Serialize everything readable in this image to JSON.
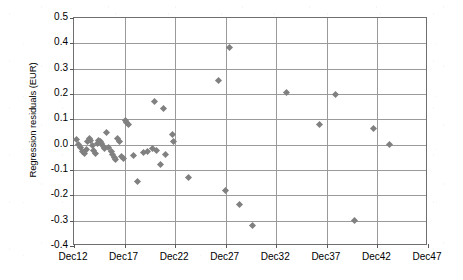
{
  "chart_data": {
    "type": "scatter",
    "title": "",
    "xlabel": "",
    "ylabel": "Regression residuals (EUR)",
    "ylim": [
      -0.4,
      0.5
    ],
    "xlim": [
      12,
      47
    ],
    "grid": true,
    "legend": false,
    "marker": {
      "shape": "diamond",
      "color": "#808080",
      "size": 5
    },
    "axis_color": "#6f6f6f",
    "gridline_color": "#9a9a9a",
    "x_tick_labels": [
      "Dec12",
      "Dec17",
      "Dec22",
      "Dec27",
      "Dec32",
      "Dec37",
      "Dec42",
      "Dec47"
    ],
    "x_tick_values": [
      12,
      17,
      22,
      27,
      32,
      37,
      42,
      47
    ],
    "y_tick_labels": [
      "0.5",
      "0.4",
      "0.3",
      "0.2",
      "0.1",
      "0.0",
      "-0.1",
      "-0.2",
      "-0.3",
      "-0.4"
    ],
    "y_tick_values": [
      0.5,
      0.4,
      0.3,
      0.2,
      0.1,
      0.0,
      -0.1,
      -0.2,
      -0.3,
      -0.4
    ],
    "points": [
      {
        "x": 12.25,
        "y": 0.022
      },
      {
        "x": 12.45,
        "y": 0.002
      },
      {
        "x": 12.65,
        "y": -0.012
      },
      {
        "x": 12.85,
        "y": -0.028
      },
      {
        "x": 13.0,
        "y": -0.034
      },
      {
        "x": 13.2,
        "y": -0.018
      },
      {
        "x": 13.35,
        "y": 0.012
      },
      {
        "x": 13.5,
        "y": 0.024
      },
      {
        "x": 13.65,
        "y": 0.016
      },
      {
        "x": 13.8,
        "y": -0.002
      },
      {
        "x": 13.95,
        "y": -0.022
      },
      {
        "x": 14.1,
        "y": -0.036
      },
      {
        "x": 14.3,
        "y": 0.006
      },
      {
        "x": 14.45,
        "y": 0.018
      },
      {
        "x": 14.6,
        "y": 0.012
      },
      {
        "x": 14.75,
        "y": 0.004
      },
      {
        "x": 14.9,
        "y": -0.006
      },
      {
        "x": 15.05,
        "y": -0.016
      },
      {
        "x": 15.2,
        "y": 0.047
      },
      {
        "x": 15.45,
        "y": -0.012
      },
      {
        "x": 15.7,
        "y": -0.028
      },
      {
        "x": 15.85,
        "y": -0.04
      },
      {
        "x": 16.0,
        "y": -0.05
      },
      {
        "x": 16.15,
        "y": -0.058
      },
      {
        "x": 16.35,
        "y": 0.024
      },
      {
        "x": 16.5,
        "y": 0.012
      },
      {
        "x": 16.7,
        "y": -0.046
      },
      {
        "x": 16.85,
        "y": -0.056
      },
      {
        "x": 17.05,
        "y": 0.094
      },
      {
        "x": 17.2,
        "y": 0.086
      },
      {
        "x": 17.4,
        "y": 0.08
      },
      {
        "x": 17.9,
        "y": -0.044
      },
      {
        "x": 18.3,
        "y": -0.144
      },
      {
        "x": 18.9,
        "y": -0.03
      },
      {
        "x": 19.3,
        "y": -0.028
      },
      {
        "x": 19.8,
        "y": -0.014
      },
      {
        "x": 20.0,
        "y": 0.169
      },
      {
        "x": 20.2,
        "y": -0.022
      },
      {
        "x": 20.6,
        "y": -0.078
      },
      {
        "x": 20.85,
        "y": 0.141
      },
      {
        "x": 21.0,
        "y": -0.038
      },
      {
        "x": 21.7,
        "y": 0.04
      },
      {
        "x": 21.8,
        "y": 0.013
      },
      {
        "x": 23.3,
        "y": -0.131
      },
      {
        "x": 26.3,
        "y": 0.253
      },
      {
        "x": 27.0,
        "y": -0.181
      },
      {
        "x": 27.4,
        "y": 0.384
      },
      {
        "x": 28.4,
        "y": -0.236
      },
      {
        "x": 29.6,
        "y": -0.319
      },
      {
        "x": 33.0,
        "y": 0.207
      },
      {
        "x": 36.3,
        "y": 0.081
      },
      {
        "x": 37.9,
        "y": 0.198
      },
      {
        "x": 39.7,
        "y": -0.298
      },
      {
        "x": 41.6,
        "y": 0.062
      },
      {
        "x": 43.2,
        "y": 0.001
      }
    ]
  }
}
